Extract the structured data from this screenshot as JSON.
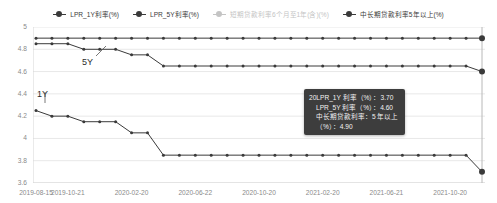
{
  "legend": {
    "items": [
      {
        "label": "LPR_1Y利率(%)",
        "color": "#3a3a3a",
        "disabled": false,
        "icon": "legend-dot-icon"
      },
      {
        "label": "LPR_5Y利率(%)",
        "color": "#3a3a3a",
        "disabled": false,
        "icon": "legend-dot-icon"
      },
      {
        "label": "短期贷款利率6个月至1年(含)(%)",
        "color": "#c4c4c4",
        "disabled": true,
        "icon": "legend-dot-icon"
      },
      {
        "label": "中长期贷款利率5年以上(%)",
        "color": "#3a3a3a",
        "disabled": false,
        "icon": "legend-dot-icon"
      }
    ]
  },
  "annotations": [
    {
      "text": "5Y",
      "x": 82,
      "y": 57
    },
    {
      "text": "1Y",
      "x": 37,
      "y": 89
    }
  ],
  "tooltip": {
    "lines": [
      {
        "text": "20LPR_1Y 利率（%）：3.70",
        "indent": false
      },
      {
        "text": "LPR_5Y 利率（%）：4.60",
        "indent": true
      },
      {
        "text": "中长期贷款利率：5 年以上",
        "indent": true
      },
      {
        "text": "（%）：4.90",
        "indent": true
      }
    ],
    "x": 304,
    "y": 89,
    "background": "#3d3d3d",
    "text_color": "#f2f2f2"
  },
  "chart_data": {
    "type": "line",
    "title": "",
    "xlabel": "",
    "ylabel": "",
    "ylim": [
      3.6,
      5.0
    ],
    "yticks": [
      5,
      4.8,
      4.6,
      4.4,
      4.2,
      4,
      3.8,
      3.6
    ],
    "xticks": [
      "2019-08-15",
      "2019-10-21",
      "2020-02-20",
      "2020-06-22",
      "2020-10-20",
      "2021-02-20",
      "2021-06-21",
      "2021-10-20"
    ],
    "grid": true,
    "legend_position": "top",
    "x": [
      "2019-08-20",
      "2019-09-20",
      "2019-10-21",
      "2019-11-20",
      "2019-12-20",
      "2020-01-20",
      "2020-02-20",
      "2020-03-20",
      "2020-04-20",
      "2020-05-20",
      "2020-06-22",
      "2020-07-20",
      "2020-08-20",
      "2020-09-21",
      "2020-10-20",
      "2020-11-20",
      "2020-12-21",
      "2021-01-20",
      "2021-02-20",
      "2021-03-22",
      "2021-04-20",
      "2021-05-20",
      "2021-06-21",
      "2021-07-20",
      "2021-08-20",
      "2021-09-22",
      "2021-10-20",
      "2021-11-22",
      "2021-12-20"
    ],
    "series": [
      {
        "name": "LPR_1Y利率(%)",
        "color": "#3a3a3a",
        "values": [
          4.25,
          4.2,
          4.2,
          4.15,
          4.15,
          4.15,
          4.05,
          4.05,
          3.85,
          3.85,
          3.85,
          3.85,
          3.85,
          3.85,
          3.85,
          3.85,
          3.85,
          3.85,
          3.85,
          3.85,
          3.85,
          3.85,
          3.85,
          3.85,
          3.85,
          3.85,
          3.85,
          3.85,
          3.8
        ],
        "final_value": 3.7,
        "highlight_last": true
      },
      {
        "name": "LPR_5Y利率(%)",
        "color": "#3a3a3a",
        "values": [
          4.85,
          4.85,
          4.85,
          4.8,
          4.8,
          4.8,
          4.75,
          4.75,
          4.65,
          4.65,
          4.65,
          4.65,
          4.65,
          4.65,
          4.65,
          4.65,
          4.65,
          4.65,
          4.65,
          4.65,
          4.65,
          4.65,
          4.65,
          4.65,
          4.65,
          4.65,
          4.65,
          4.65,
          4.6
        ],
        "final_value": 4.6,
        "highlight_last": true
      },
      {
        "name": "中长期贷款利率5年以上(%)",
        "color": "#3a3a3a",
        "values": [
          4.9,
          4.9,
          4.9,
          4.9,
          4.9,
          4.9,
          4.9,
          4.9,
          4.9,
          4.9,
          4.9,
          4.9,
          4.9,
          4.9,
          4.9,
          4.9,
          4.9,
          4.9,
          4.9,
          4.9,
          4.9,
          4.9,
          4.9,
          4.9,
          4.9,
          4.9,
          4.9,
          4.9,
          4.9
        ],
        "final_value": 4.9,
        "highlight_last": true
      }
    ],
    "crosshair": {
      "x": "2021-12-20",
      "visible": true
    }
  }
}
